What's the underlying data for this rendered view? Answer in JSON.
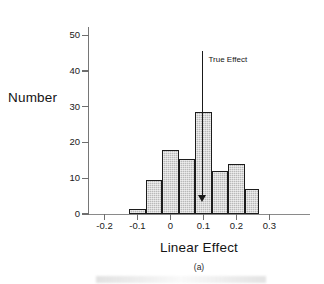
{
  "chart_data": {
    "type": "bar",
    "title": "",
    "subtitle": "",
    "xlabel": "Linear Effect",
    "ylabel": "Number",
    "caption": "(a)",
    "grid": false,
    "legend": null,
    "xlim": [
      -0.25,
      0.32
    ],
    "ylim": [
      0,
      52
    ],
    "xticks": [
      -0.2,
      -0.1,
      0,
      0.1,
      0.2,
      0.3
    ],
    "xtick_labels": [
      "-0.2",
      "-0.1",
      "0",
      "0.1",
      "0.2",
      "0.3"
    ],
    "yticks": [
      0,
      10,
      20,
      30,
      40,
      50
    ],
    "ytick_labels": [
      "0",
      "10",
      "20",
      "30",
      "40",
      "50"
    ],
    "bin_width": 0.05,
    "bins": [
      {
        "left": -0.125,
        "right": -0.075,
        "center": -0.1,
        "value": 1.5
      },
      {
        "left": -0.075,
        "right": -0.025,
        "center": -0.05,
        "value": 9.5
      },
      {
        "left": -0.025,
        "right": 0.025,
        "center": 0.0,
        "value": 18
      },
      {
        "left": 0.025,
        "right": 0.075,
        "center": 0.05,
        "value": 15.5
      },
      {
        "left": 0.075,
        "right": 0.125,
        "center": 0.1,
        "value": 28.5
      },
      {
        "left": 0.125,
        "right": 0.175,
        "center": 0.15,
        "value": 12
      },
      {
        "left": 0.175,
        "right": 0.225,
        "center": 0.2,
        "value": 14
      },
      {
        "left": 0.225,
        "right": 0.27,
        "center": 0.25,
        "value": 7
      }
    ],
    "categories": [
      "-0.10",
      "-0.05",
      "0.00",
      "0.05",
      "0.10",
      "0.15",
      "0.20",
      "0.25"
    ],
    "values": [
      1.5,
      9.5,
      18,
      15.5,
      28.5,
      12,
      14,
      7
    ],
    "annotations": [
      {
        "label": "True Effect",
        "x": 0.097,
        "y_top": 45.5,
        "y_tip": 3.5,
        "style": "down-arrow-with-text"
      }
    ],
    "colors": {
      "bar_fill": "#b9b9b9",
      "bar_edge": "#1c1c1c",
      "axis": "#767676",
      "text": "#141414",
      "annotation": "#1a1a1a"
    }
  }
}
